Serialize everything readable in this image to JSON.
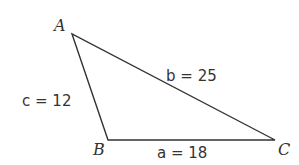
{
  "diagram": {
    "type": "triangle",
    "vertices": [
      {
        "name": "A",
        "x": 72,
        "y": 34,
        "label_x": 54,
        "label_y": 31
      },
      {
        "name": "B",
        "x": 108,
        "y": 140,
        "label_x": 93,
        "label_y": 155
      },
      {
        "name": "C",
        "x": 275,
        "y": 140,
        "label_x": 278,
        "label_y": 155
      }
    ],
    "sides": [
      {
        "name": "a",
        "length": 18,
        "text": "a = 18",
        "x": 157,
        "y": 158
      },
      {
        "name": "b",
        "length": 25,
        "text": "b = 25",
        "x": 166,
        "y": 81
      },
      {
        "name": "c",
        "length": 12,
        "text": "c = 12",
        "x": 22,
        "y": 106
      }
    ],
    "stroke_color": "#333333"
  }
}
